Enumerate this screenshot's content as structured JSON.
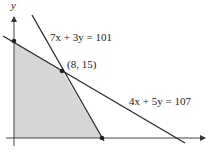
{
  "diagram": {
    "axis_labels": {
      "y": "y"
    },
    "lines": [
      {
        "id": "line1",
        "equation": "7x + 3y = 101"
      },
      {
        "id": "line2",
        "equation": "4x + 5y = 107"
      }
    ],
    "points": [
      {
        "id": "intersection",
        "label": "(8, 15)"
      }
    ],
    "feasible_region": {
      "description": "shaded region bounded by axes and both lines",
      "fill_color": "#d6d6d6"
    },
    "line_color": "#2a2a2a"
  }
}
